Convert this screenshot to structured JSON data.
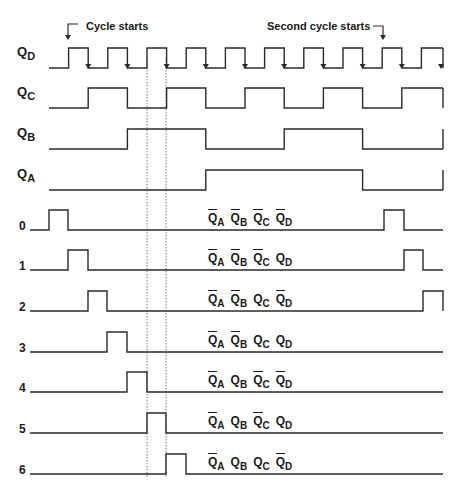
{
  "annotations": {
    "cycle_starts": "Cycle starts",
    "second_cycle_starts": "Second cycle starts"
  },
  "signals": [
    {
      "name": "Q",
      "sub": "D",
      "baseline": 68,
      "high": 48
    },
    {
      "name": "Q",
      "sub": "C",
      "baseline": 108,
      "high": 88
    },
    {
      "name": "Q",
      "sub": "B",
      "baseline": 149,
      "high": 129
    },
    {
      "name": "Q",
      "sub": "A",
      "baseline": 190,
      "high": 170
    }
  ],
  "decoded_outputs": [
    {
      "label": "0",
      "baseline": 230,
      "high": 210,
      "state": [
        {
          "v": "Q",
          "s": "A",
          "bar": true
        },
        {
          "v": "Q",
          "s": "B",
          "bar": true
        },
        {
          "v": "Q",
          "s": "C",
          "bar": true
        },
        {
          "v": "Q",
          "s": "D",
          "bar": true
        }
      ]
    },
    {
      "label": "1",
      "baseline": 270,
      "high": 250,
      "state": [
        {
          "v": "Q",
          "s": "A",
          "bar": true
        },
        {
          "v": "Q",
          "s": "B",
          "bar": true
        },
        {
          "v": "Q",
          "s": "C",
          "bar": true
        },
        {
          "v": "Q",
          "s": "D",
          "bar": false
        }
      ]
    },
    {
      "label": "2",
      "baseline": 311,
      "high": 291,
      "state": [
        {
          "v": "Q",
          "s": "A",
          "bar": true
        },
        {
          "v": "Q",
          "s": "B",
          "bar": true
        },
        {
          "v": "Q",
          "s": "C",
          "bar": false
        },
        {
          "v": "Q",
          "s": "D",
          "bar": true
        }
      ]
    },
    {
      "label": "3",
      "baseline": 352,
      "high": 332,
      "state": [
        {
          "v": "Q",
          "s": "A",
          "bar": true
        },
        {
          "v": "Q",
          "s": "B",
          "bar": true
        },
        {
          "v": "Q",
          "s": "C",
          "bar": false
        },
        {
          "v": "Q",
          "s": "D",
          "bar": false
        }
      ]
    },
    {
      "label": "4",
      "baseline": 392,
      "high": 372,
      "state": [
        {
          "v": "Q",
          "s": "A",
          "bar": true
        },
        {
          "v": "Q",
          "s": "B",
          "bar": false
        },
        {
          "v": "Q",
          "s": "C",
          "bar": true
        },
        {
          "v": "Q",
          "s": "D",
          "bar": true
        }
      ]
    },
    {
      "label": "5",
      "baseline": 433,
      "high": 413,
      "state": [
        {
          "v": "Q",
          "s": "A",
          "bar": true
        },
        {
          "v": "Q",
          "s": "B",
          "bar": false
        },
        {
          "v": "Q",
          "s": "C",
          "bar": true
        },
        {
          "v": "Q",
          "s": "D",
          "bar": false
        }
      ]
    },
    {
      "label": "6",
      "baseline": 474,
      "high": 454,
      "state": [
        {
          "v": "Q",
          "s": "A",
          "bar": true
        },
        {
          "v": "Q",
          "s": "B",
          "bar": false
        },
        {
          "v": "Q",
          "s": "C",
          "bar": false
        },
        {
          "v": "Q",
          "s": "D",
          "bar": true
        }
      ]
    }
  ],
  "timing": {
    "x_start": 49,
    "x_end": 443,
    "step": 19.6,
    "waveforms": {
      "QD": [
        0,
        1,
        0,
        1,
        0,
        1,
        0,
        1,
        0,
        1,
        0,
        1,
        0,
        1,
        0,
        1,
        0,
        1,
        0,
        1
      ],
      "QC": [
        0,
        0,
        1,
        1,
        0,
        0,
        1,
        1,
        0,
        0,
        1,
        1,
        0,
        0,
        1,
        1,
        0,
        0,
        1,
        1
      ],
      "QB": [
        0,
        0,
        0,
        0,
        1,
        1,
        1,
        1,
        0,
        0,
        0,
        0,
        1,
        1,
        1,
        1,
        0,
        0,
        0,
        0
      ],
      "QA": [
        0,
        0,
        0,
        0,
        0,
        0,
        0,
        0,
        1,
        1,
        1,
        1,
        1,
        1,
        1,
        1,
        0,
        0,
        0,
        0
      ]
    },
    "pulses": {
      "0": [
        [
          49,
          68
        ],
        [
          384,
          404
        ]
      ],
      "1": [
        [
          68,
          88
        ],
        [
          404,
          423
        ]
      ],
      "2": [
        [
          88,
          107
        ],
        [
          423,
          443
        ]
      ],
      "3": [
        [
          107,
          127
        ]
      ],
      "4": [
        [
          127,
          147
        ]
      ],
      "5": [
        [
          147,
          166
        ]
      ],
      "6": [
        [
          166,
          186
        ]
      ]
    },
    "dotted_markers": [
      147,
      166
    ]
  },
  "colors": {
    "line": "#2a2a2a",
    "dotted": "#555555",
    "background": "#ffffff"
  }
}
